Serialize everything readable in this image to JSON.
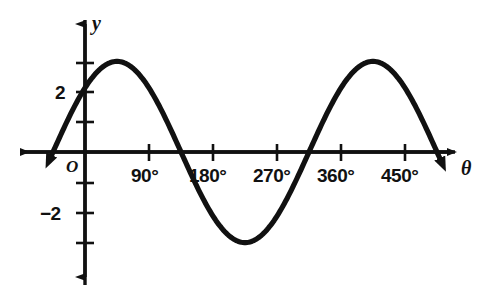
{
  "figure": {
    "background_color": "#ffffff",
    "ink_color": "#111111",
    "width": 483,
    "height": 293
  },
  "axes": {
    "x_axis_name": "θ",
    "y_axis_name": "y",
    "origin_label": "O"
  },
  "x_tick_labels": [
    {
      "text": "90°",
      "value": 90,
      "px": 149
    },
    {
      "text": "180°",
      "value": 180,
      "px": 213
    },
    {
      "text": "270°",
      "value": 270,
      "px": 277
    },
    {
      "text": "360°",
      "value": 360,
      "px": 341
    },
    {
      "text": "450°",
      "value": 450,
      "px": 405
    }
  ],
  "y_tick_labels": [
    {
      "text": "2",
      "value": 2,
      "px": 92
    },
    {
      "text": "−2",
      "value": -2,
      "px": 213
    }
  ],
  "chart_data": {
    "type": "line",
    "title": "",
    "xlabel": "θ",
    "ylabel": "y",
    "grid": false,
    "legend": "none",
    "xlim": [
      -22,
      495
    ],
    "ylim": [
      -4.5,
      4.5
    ],
    "xticks": [
      90,
      180,
      270,
      360,
      450
    ],
    "xticklabels": [
      "90°",
      "180°",
      "270°",
      "360°",
      "450°"
    ],
    "yticks": [
      -3,
      -2,
      -1,
      1,
      2,
      3
    ],
    "yticklabels": [
      "",
      "−2",
      "",
      "",
      "2",
      ""
    ],
    "annotations": [
      "O"
    ],
    "series": [
      {
        "name": "y = 3 sin(θ + 45°)",
        "equation": "y = 3 sin(θ + 45°)",
        "amplitude": 3,
        "period": 360,
        "phase_shift_deg": 45,
        "vertical_shift": 0,
        "arrow_start": true,
        "arrow_end": true,
        "key_points": [
          {
            "theta": -45,
            "y": 0
          },
          {
            "theta": 0,
            "y": 2.12
          },
          {
            "theta": 45,
            "y": 3
          },
          {
            "theta": 135,
            "y": 0
          },
          {
            "theta": 225,
            "y": -3
          },
          {
            "theta": 315,
            "y": 0
          },
          {
            "theta": 405,
            "y": 3
          },
          {
            "theta": 495,
            "y": 0
          }
        ],
        "x": [
          -60,
          -45,
          -30,
          -15,
          0,
          15,
          30,
          45,
          60,
          75,
          90,
          105,
          120,
          135,
          150,
          165,
          180,
          195,
          210,
          225,
          240,
          255,
          270,
          285,
          300,
          315,
          330,
          345,
          360,
          375,
          390,
          405,
          420,
          435,
          450,
          465,
          480,
          495,
          510
        ],
        "values": [
          -0.78,
          0,
          0.78,
          1.5,
          2.12,
          2.6,
          2.9,
          3,
          2.9,
          2.6,
          2.12,
          1.5,
          0.78,
          0,
          -0.78,
          -1.5,
          -2.12,
          -2.6,
          -2.9,
          -3,
          -2.9,
          -2.6,
          -2.12,
          -1.5,
          -0.78,
          0,
          0.78,
          1.5,
          2.12,
          2.6,
          2.9,
          3,
          2.9,
          2.6,
          2.12,
          1.5,
          0.78,
          0,
          -0.78
        ]
      }
    ]
  }
}
